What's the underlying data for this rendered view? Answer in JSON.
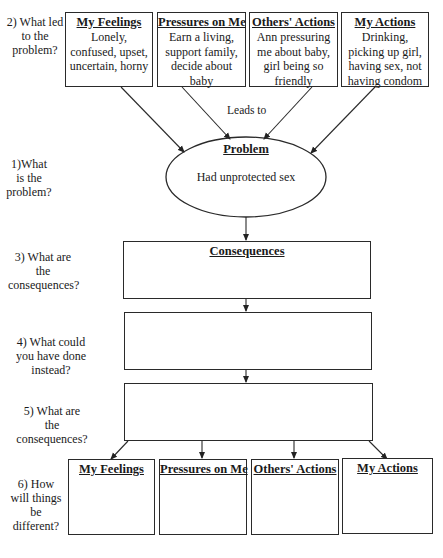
{
  "questions": {
    "q2": "2) What led to the problem?",
    "q1": "1)What is the problem?",
    "q3": "3) What are the consequences?",
    "q4": "4) What could you have done instead?",
    "q5": "5) What are the consequences?",
    "q6": "6) How will things be different?"
  },
  "top_boxes": [
    {
      "title": "My Feelings",
      "body": "Lonely, confused, upset, uncertain, horny"
    },
    {
      "title": "Pressures on Me",
      "body": "Earn a living, support family, decide about baby"
    },
    {
      "title": "Others' Actions",
      "body": "Ann pressuring me about baby, girl being so friendly"
    },
    {
      "title": "My Actions",
      "body": "Drinking, picking up girl, having sex, not having condom"
    }
  ],
  "connector_label": "Leads to",
  "problem": {
    "title": "Problem",
    "body": "Had unprotected sex"
  },
  "consequences": {
    "title": "Consequences",
    "body": ""
  },
  "alternative": {
    "body": ""
  },
  "alt_consequences": {
    "body": ""
  },
  "bottom_boxes": [
    {
      "title": "My Feelings",
      "body": ""
    },
    {
      "title": "Pressures on Me",
      "body": ""
    },
    {
      "title": "Others' Actions",
      "body": ""
    },
    {
      "title": "My Actions",
      "body": ""
    }
  ]
}
